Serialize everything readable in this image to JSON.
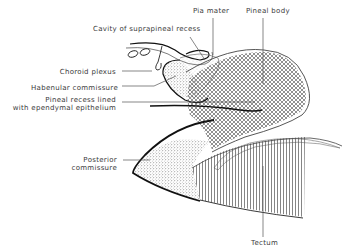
{
  "figure": {
    "labels": {
      "pia_mater": "Pia mater",
      "pineal_body": "Pineal body",
      "cavity_suprapineal": "Cavity of suprapineal recess",
      "choroid_plexus": "Choroid plexus",
      "habenular_commissure": "Habenular commissure",
      "pineal_recess_1": "Pineal recess lined",
      "pineal_recess_2": "with ependymal epithelium",
      "posterior_commissure_1": "Posterior",
      "posterior_commissure_2": "commissure",
      "tectum": "Tectum"
    },
    "colors": {
      "ink": "#1a1a1a",
      "label_text": "#3a3a3a",
      "background": "#ffffff"
    }
  }
}
